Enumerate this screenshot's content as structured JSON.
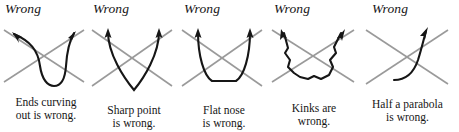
{
  "figure": {
    "background_color": "#ffffff",
    "ink_color": "#161616",
    "cross_color": "#9a9a9a",
    "panels": [
      {
        "title": "Wrong",
        "caption_lines": [
          "Ends curving",
          "out is wrong."
        ],
        "art_name": "narrow-u-with-flared-ends",
        "arrows": [
          "up-left",
          "up-right"
        ]
      },
      {
        "title": "Wrong",
        "caption_lines": [
          "Sharp point",
          "is wrong."
        ],
        "art_name": "sharp-v-curve",
        "arrows": [
          "up",
          "up"
        ]
      },
      {
        "title": "Wrong",
        "caption_lines": [
          "Flat nose",
          "is wrong."
        ],
        "art_name": "flat-bottom-u-curve",
        "arrows": [
          "up",
          "up"
        ]
      },
      {
        "title": "Wrong",
        "caption_lines": [
          "Kinks are",
          "wrong."
        ],
        "art_name": "kinked-wavy-u-curve",
        "arrows": [
          "up-left",
          "up-right"
        ]
      },
      {
        "title": "Wrong",
        "caption_lines": [
          "Half a parabola",
          "is wrong."
        ],
        "art_name": "half-parabola-curve",
        "arrows": [
          "up-right"
        ]
      }
    ]
  }
}
